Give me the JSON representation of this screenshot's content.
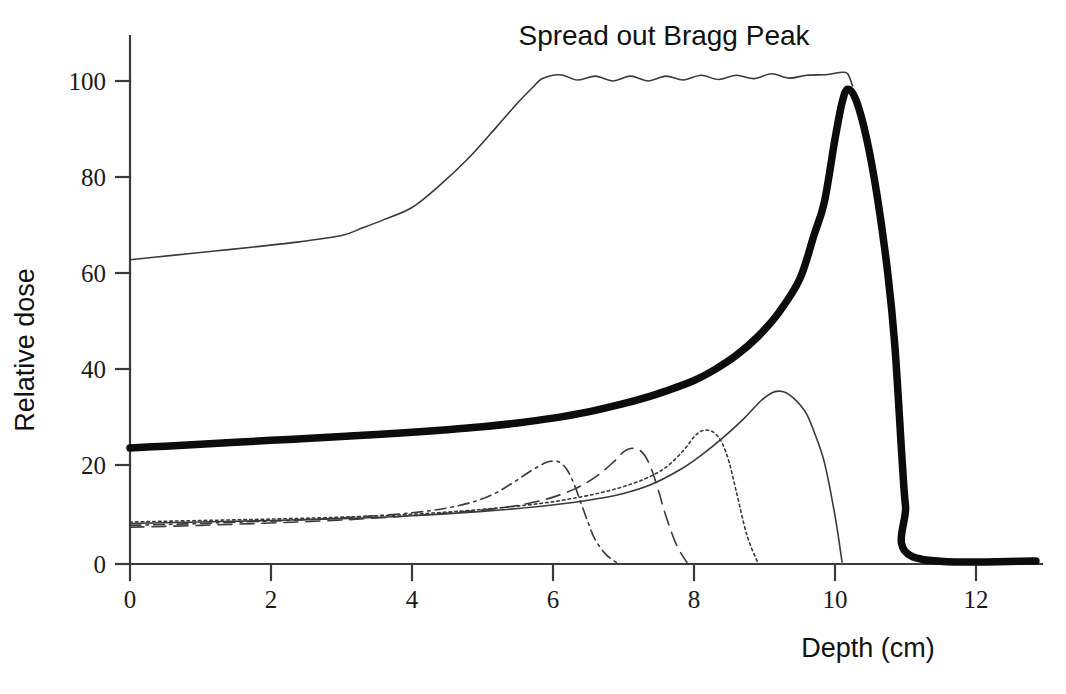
{
  "chart_data": {
    "type": "line",
    "title": "Spread out Bragg Peak",
    "xlabel": "Depth (cm)",
    "ylabel": "Relative dose",
    "xlim": [
      -0.35,
      12.85
    ],
    "ylim": [
      0,
      108
    ],
    "xticks": [
      0,
      2,
      4,
      6,
      8,
      10,
      12
    ],
    "xticklabels": [
      "0",
      "2",
      "4",
      "6",
      "8",
      "10",
      "12"
    ],
    "yticks": [
      0,
      20,
      40,
      60,
      80,
      100
    ],
    "yticklabels": [
      "0",
      "20",
      "40",
      "60",
      "80",
      "100"
    ],
    "grid": false,
    "legend": "none",
    "annotations": [
      {
        "text": "Spread out Bragg Peak",
        "x": 7.0,
        "y": 107,
        "placement": "above-plateau"
      }
    ],
    "series": [
      {
        "name": "Spread out Bragg Peak (total dose)",
        "style": "thick-solid",
        "linewidth": 7.5,
        "x": [
          0.0,
          0.5,
          1.0,
          1.5,
          2.0,
          2.5,
          3.0,
          3.5,
          4.0,
          4.5,
          5.0,
          5.5,
          6.0,
          6.5,
          7.0,
          7.3,
          7.6,
          8.0,
          8.3,
          8.6,
          8.9,
          9.2,
          9.5,
          9.7,
          9.85,
          10.0,
          10.1,
          10.18,
          10.3,
          10.45,
          10.6,
          10.75,
          10.85,
          10.95,
          11.0,
          11.1,
          12.85
        ],
        "y": [
          24.0,
          24.4,
          24.8,
          25.2,
          25.6,
          26.0,
          26.4,
          26.8,
          27.3,
          27.8,
          28.4,
          29.2,
          30.2,
          31.5,
          33.2,
          34.4,
          35.8,
          38.0,
          40.3,
          43.2,
          47.0,
          52.0,
          59.0,
          68.0,
          75.0,
          88.0,
          95.5,
          98.3,
          96.0,
          88.0,
          76.0,
          60.0,
          45.0,
          22.0,
          12.0,
          1.5,
          0.6
        ]
      },
      {
        "name": "Spread out Bragg Peak (upper envelope / plateau)",
        "style": "thin-solid",
        "linewidth": 1.6,
        "x": [
          0.0,
          0.6,
          1.2,
          1.8,
          2.4,
          3.0,
          3.3,
          3.6,
          4.0,
          4.4,
          4.8,
          5.2,
          5.5,
          5.7,
          5.85,
          6.1,
          6.35,
          6.6,
          6.85,
          7.1,
          7.35,
          7.6,
          7.85,
          8.1,
          8.35,
          8.6,
          8.85,
          9.1,
          9.35,
          9.6,
          9.85,
          10.0,
          10.1,
          10.18,
          10.25
        ],
        "y": [
          63.0,
          63.9,
          64.8,
          65.7,
          66.7,
          68.0,
          69.6,
          71.3,
          73.8,
          78.5,
          84.0,
          90.5,
          95.5,
          98.5,
          100.5,
          101.3,
          100.2,
          101.0,
          100.0,
          101.0,
          100.0,
          101.0,
          100.2,
          101.2,
          100.3,
          101.2,
          100.5,
          101.5,
          100.6,
          101.2,
          101.3,
          101.6,
          101.8,
          101.5,
          99.0
        ]
      },
      {
        "name": "Pristine Bragg peak 1 (range 6.3 cm)",
        "style": "dash-dot",
        "linewidth": 1.6,
        "x": [
          0.0,
          0.8,
          1.6,
          2.4,
          3.2,
          4.0,
          4.5,
          4.9,
          5.2,
          5.45,
          5.7,
          5.9,
          6.0,
          6.1,
          6.2,
          6.3,
          6.4,
          6.5,
          6.6,
          6.75,
          6.9
        ],
        "y": [
          8.0,
          8.3,
          8.7,
          9.1,
          9.7,
          10.6,
          11.6,
          13.0,
          14.8,
          17.0,
          19.4,
          21.0,
          21.3,
          21.0,
          19.5,
          16.5,
          12.5,
          8.5,
          5.0,
          2.0,
          0.3
        ]
      },
      {
        "name": "Pristine Bragg peak 2 (range 7.3 cm)",
        "style": "dashed",
        "linewidth": 1.6,
        "x": [
          0.0,
          1.0,
          2.0,
          3.0,
          4.0,
          4.8,
          5.4,
          5.9,
          6.3,
          6.6,
          6.85,
          7.0,
          7.1,
          7.2,
          7.3,
          7.4,
          7.5,
          7.6,
          7.75,
          7.9
        ],
        "y": [
          7.6,
          8.0,
          8.5,
          9.1,
          10.0,
          10.9,
          11.9,
          13.4,
          15.5,
          18.0,
          21.0,
          23.2,
          23.9,
          23.8,
          22.5,
          19.5,
          15.0,
          10.0,
          4.0,
          0.3
        ]
      },
      {
        "name": "Pristine Bragg peak 3 (range 8.4 cm)",
        "style": "dotted",
        "linewidth": 1.6,
        "x": [
          0.0,
          1.0,
          2.0,
          3.0,
          4.0,
          5.0,
          5.8,
          6.4,
          6.9,
          7.3,
          7.6,
          7.85,
          8.0,
          8.1,
          8.2,
          8.3,
          8.4,
          8.5,
          8.6,
          8.75,
          8.9
        ],
        "y": [
          8.7,
          9.0,
          9.3,
          9.7,
          10.3,
          11.3,
          12.5,
          13.9,
          15.6,
          17.6,
          20.0,
          23.5,
          26.3,
          27.5,
          27.7,
          27.0,
          25.0,
          21.0,
          15.0,
          6.0,
          0.4
        ]
      },
      {
        "name": "Pristine Bragg peak 4 (range 9.6 cm)",
        "style": "thin-solid",
        "linewidth": 1.6,
        "x": [
          0.0,
          1.0,
          2.0,
          3.0,
          4.0,
          5.0,
          5.8,
          6.5,
          7.0,
          7.4,
          7.8,
          8.1,
          8.4,
          8.7,
          8.95,
          9.1,
          9.2,
          9.3,
          9.4,
          9.5,
          9.6,
          9.7,
          9.85,
          10.0,
          10.1
        ],
        "y": [
          8.4,
          8.7,
          9.0,
          9.4,
          10.0,
          10.9,
          11.9,
          13.2,
          14.6,
          16.5,
          19.5,
          22.5,
          26.0,
          30.0,
          33.8,
          35.4,
          35.8,
          35.5,
          34.5,
          33.0,
          31.0,
          27.5,
          21.0,
          10.0,
          0.4
        ]
      }
    ]
  },
  "axes": {
    "x_axis_title": "Depth (cm)",
    "y_axis_title": "Relative dose",
    "x_tick_labels": [
      "0",
      "2",
      "4",
      "6",
      "8",
      "10",
      "12"
    ],
    "y_tick_labels": [
      "0",
      "20",
      "40",
      "60",
      "80",
      "100"
    ]
  },
  "title": {
    "text": "Spread out Bragg Peak"
  },
  "colors": {
    "background": "#ffffff",
    "axis": "#3b3b3b",
    "curve": "#2b2b2b",
    "text": "#111111"
  }
}
